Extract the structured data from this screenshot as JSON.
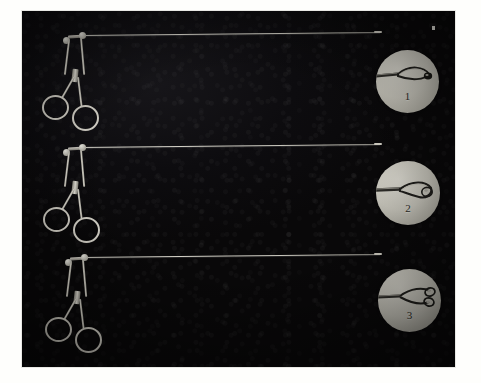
{
  "plate": {
    "kind": "photographic-plate",
    "title": "",
    "caption": "",
    "background_color": "#0b0a0c",
    "mount_color": "#fefefc",
    "photo_bounds": {
      "x": 22,
      "y": 11,
      "width": 433,
      "height": 356
    },
    "artifact": {
      "name": "emulsion-speck",
      "x": 432,
      "y": 26
    }
  },
  "instruments": [
    {
      "index": "1",
      "label": "1",
      "name": "ring-handled long-shaft grasping forceps",
      "handle": "scissors-style double finger ring",
      "shaft": "long straight slender tubular shaft",
      "inset_caption": "1",
      "inset_detail": "closed slender looped wire jaw, oval fenestrated tip",
      "metal_color": "#d9d6cc"
    },
    {
      "index": "2",
      "label": "2",
      "name": "ring-handled long-shaft grasping forceps",
      "handle": "scissors-style double finger ring",
      "shaft": "long straight slender tubular shaft",
      "inset_caption": "2",
      "inset_detail": "closed broad spoon-shaped fenestrated cup jaw",
      "metal_color": "#d9d6cc"
    },
    {
      "index": "3",
      "label": "3",
      "name": "ring-handled long-shaft grasping forceps",
      "handle": "scissors-style double finger ring",
      "shaft": "long straight slender tubular shaft",
      "inset_caption": "3",
      "inset_detail": "open paired oval cup jaws, spread apart",
      "metal_color": "#d9d6cc"
    }
  ],
  "colors": {
    "photo_black": "#0b0a0c",
    "inset_disc": "#c6c4ba",
    "steel_highlight": "#f2f0e8",
    "steel_shadow": "#6d6b63",
    "mount_white": "#fefefc"
  }
}
